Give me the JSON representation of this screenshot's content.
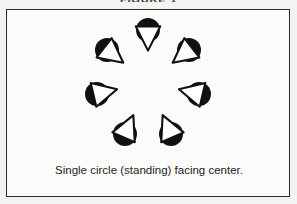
{
  "figure": {
    "title": "FIGURE 1",
    "caption": "Single circle (standing) facing center.",
    "frame": {
      "border_color": "#2b2b2b",
      "fill_color": "#fbfbfa"
    },
    "background_color": "#f4f3f1",
    "ink_color": "#111111"
  },
  "diagram": {
    "type": "formation-diagram",
    "formation_name": "single circle",
    "facing": "center",
    "posture": "standing",
    "dancer_count": 7,
    "circle_center": {
      "x": 141,
      "y": 72
    },
    "circle_radius": 52,
    "symbol": {
      "head_shape": "filled-circle",
      "head_radius": 12,
      "body_shape": "outlined-triangle",
      "body_fill": "#ffffff",
      "body_stroke": "#111111",
      "head_fill": "#111111",
      "note": "triangle apex points toward circle center"
    },
    "dancers": [
      {
        "id": "dancer-1",
        "label": "top",
        "angle_deg": 270,
        "x": 141,
        "y": 20,
        "facing_deg": 90
      },
      {
        "id": "dancer-2",
        "label": "upper-left",
        "angle_deg": 218,
        "x": 100,
        "y": 40,
        "facing_deg": 38
      },
      {
        "id": "dancer-3",
        "label": "upper-right",
        "angle_deg": 322,
        "x": 182,
        "y": 40,
        "facing_deg": 142
      },
      {
        "id": "dancer-4",
        "label": "middle-left",
        "angle_deg": 167,
        "x": 90,
        "y": 84,
        "facing_deg": 347
      },
      {
        "id": "dancer-5",
        "label": "middle-right",
        "angle_deg": 13,
        "x": 192,
        "y": 84,
        "facing_deg": 193
      },
      {
        "id": "dancer-6",
        "label": "lower-left",
        "angle_deg": 116,
        "x": 118,
        "y": 124,
        "facing_deg": 296
      },
      {
        "id": "dancer-7",
        "label": "lower-right",
        "angle_deg": 64,
        "x": 164,
        "y": 124,
        "facing_deg": 244
      }
    ]
  }
}
